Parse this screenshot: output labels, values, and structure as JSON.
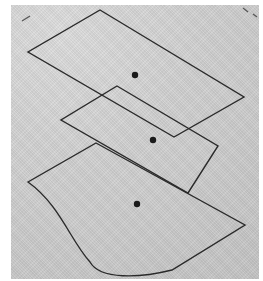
{
  "diagram": {
    "background_color": "#c9c9c9",
    "line_color": "#2a2a2a",
    "planes": [
      {
        "name": "top-plane",
        "shape": "parallelogram",
        "points": "100,10 244,97 174,137 28,52",
        "center": {
          "x": 135,
          "y": 75
        }
      },
      {
        "name": "middle-plane",
        "shape": "parallelogram",
        "points": "117,86 218,146 188,193 61,120",
        "center": {
          "x": 153,
          "y": 140
        }
      },
      {
        "name": "bottom-plane",
        "shape": "curved-edge plane",
        "path": "M96,143 L245,225 L172,270 C140,278 100,280 90,262 C70,240 60,205 28,182 Z",
        "center": {
          "x": 137,
          "y": 204
        }
      }
    ]
  }
}
